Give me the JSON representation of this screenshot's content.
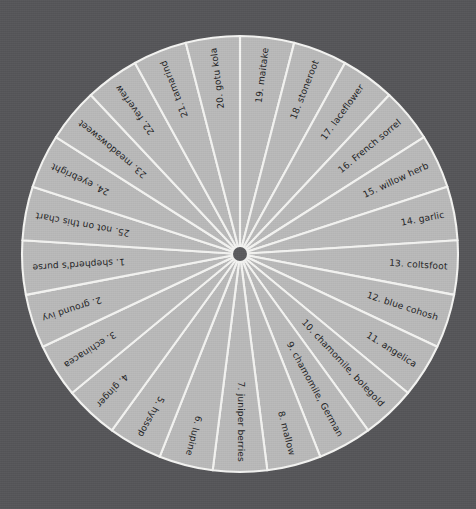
{
  "chart_data": {
    "type": "pie",
    "title": "",
    "subtitle": "",
    "xlabel": "",
    "ylabel": "",
    "legend_position": "none",
    "grid": false,
    "slice_count": 25,
    "equal_slices": true,
    "slice_angle_degrees": 14.4,
    "start_angle_degrees": 0,
    "direction": "clockwise",
    "categories": [
      "1. shepherd's purse",
      "2. ground ivy",
      "3. echinacea",
      "4. ginger",
      "5. hyssop",
      "6. lupine",
      "7. juniper berries",
      "8. mallow",
      "9. chamomile, German",
      "10. chamomile, bolegold",
      "11. angelica",
      "12. blue cohosh",
      "13. coltsfoot",
      "14. garlic",
      "15. willow herb",
      "16. French sorrel",
      "17. laceflower",
      "18. stoneroot",
      "19. maitake",
      "20. gotu kola",
      "21. tamarind",
      "22. feverfew",
      "23. meadowsweet",
      "24. eyebright",
      "25. not on this chart"
    ],
    "values": [
      4,
      4,
      4,
      4,
      4,
      4,
      4,
      4,
      4,
      4,
      4,
      4,
      4,
      4,
      4,
      4,
      4,
      4,
      4,
      4,
      4,
      4,
      4,
      4,
      4
    ]
  },
  "wheel": {
    "center_x": 240,
    "center_y": 254,
    "radius": 218,
    "hub_radius": 7,
    "slices": [
      {
        "index": 1,
        "number": "1.",
        "name": "shepherd's purse",
        "label": "1.  shepherd's purse"
      },
      {
        "index": 2,
        "number": "2.",
        "name": "ground ivy",
        "label": "2.  ground ivy"
      },
      {
        "index": 3,
        "number": "3.",
        "name": "echinacea",
        "label": "3.  echinacea"
      },
      {
        "index": 4,
        "number": "4.",
        "name": "ginger",
        "label": "4.  ginger"
      },
      {
        "index": 5,
        "number": "5.",
        "name": "hyssop",
        "label": "5.  hyssop"
      },
      {
        "index": 6,
        "number": "6.",
        "name": "lupine",
        "label": "6.  lupine"
      },
      {
        "index": 7,
        "number": "7.",
        "name": "juniper berries",
        "label": "7.  juniper berries"
      },
      {
        "index": 8,
        "number": "8.",
        "name": "mallow",
        "label": "8.  mallow"
      },
      {
        "index": 9,
        "number": "9.",
        "name": "chamomile, German",
        "label": "9.  chamomile, German"
      },
      {
        "index": 10,
        "number": "10.",
        "name": "chamomile, bolegold",
        "label": "10.  chamomile, bolegold"
      },
      {
        "index": 11,
        "number": "11.",
        "name": "angelica",
        "label": "11.  angelica"
      },
      {
        "index": 12,
        "number": "12.",
        "name": "blue cohosh",
        "label": "12.  blue cohosh"
      },
      {
        "index": 13,
        "number": "13.",
        "name": "coltsfoot",
        "label": "13.  coltsfoot"
      },
      {
        "index": 14,
        "number": "14.",
        "name": "garlic",
        "label": "14.  garlic"
      },
      {
        "index": 15,
        "number": "15.",
        "name": "willow herb",
        "label": "15.  willow herb"
      },
      {
        "index": 16,
        "number": "16.",
        "name": "French sorrel",
        "label": "16.  French sorrel"
      },
      {
        "index": 17,
        "number": "17.",
        "name": "laceflower",
        "label": "17.  laceflower"
      },
      {
        "index": 18,
        "number": "18.",
        "name": "stoneroot",
        "label": "18.  stoneroot"
      },
      {
        "index": 19,
        "number": "19.",
        "name": "maitake",
        "label": "19.  maitake"
      },
      {
        "index": 20,
        "number": "20.",
        "name": "gotu kola",
        "label": "20.  gotu kola"
      },
      {
        "index": 21,
        "number": "21.",
        "name": "tamarind",
        "label": "21.  tamarind"
      },
      {
        "index": 22,
        "number": "22.",
        "name": "feverfew",
        "label": "22.  feverfew"
      },
      {
        "index": 23,
        "number": "23.",
        "name": "meadowsweet",
        "label": "23.  meadowsweet"
      },
      {
        "index": 24,
        "number": "24.",
        "name": "eyebright",
        "label": "24.  eyebright"
      },
      {
        "index": 25,
        "number": "25.",
        "name": "not on this chart",
        "label": "25.  not on this chart"
      }
    ]
  },
  "colors": {
    "background": "#555558",
    "sector_fill": "#b9b9b9",
    "divider": "#f4f4f2",
    "hub": "#5b5b5e",
    "label_text": "#1c1c1e"
  }
}
